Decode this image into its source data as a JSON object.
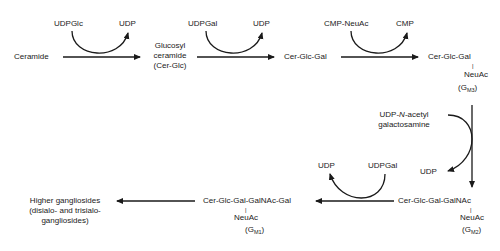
{
  "diagram": {
    "type": "biosynthesis-pathway",
    "nodes": {
      "ceramide": "Ceramide",
      "glucosyl_ceramide": [
        "Glucosyl",
        "ceramide",
        "(Cer-Glc)"
      ],
      "cer_glc_gal": "Cer-Glc-Gal",
      "gm3": {
        "chain": "Cer-Glc-Gal",
        "branch_bar": "|",
        "branch": "NeuAc",
        "label_open": "(G",
        "label_sub": "M3",
        "label_close": ")"
      },
      "gm2": {
        "chain": "Cer-Glc-Gal-GalNAc",
        "branch_bar": "|",
        "branch": "NeuAc",
        "label_open": "(G",
        "label_sub": "M2",
        "label_close": ")"
      },
      "gm1": {
        "chain": "Cer-Glc-Gal-GalNAc-Gal",
        "branch_bar": "|",
        "branch": "NeuAc",
        "label_open": "(G",
        "label_sub": "M1",
        "label_close": ")"
      },
      "higher": [
        "Higher gangliosides",
        "(disialo- and trisialo-",
        "gangliosides)"
      ]
    },
    "cofactors": {
      "step1_in": "UDPGlc",
      "step1_out": "UDP",
      "step2_in": "UDPGal",
      "step2_out": "UDP",
      "step3_in": "CMP-NeuAc",
      "step3_out": "CMP",
      "step4_in_pre": "UDP-",
      "step4_in_italic": "N",
      "step4_in_post": "-acetyl",
      "step4_in_line2": "galactosamine",
      "step4_out": "UDP",
      "step5_in": "UDPGal",
      "step5_out": "UDP"
    },
    "colors": {
      "line": "#1a1a1a",
      "text": "#1a1a1a",
      "background": "#ffffff"
    }
  }
}
